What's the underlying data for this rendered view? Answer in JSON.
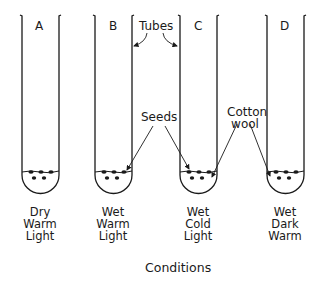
{
  "diagram": {
    "tubes": [
      {
        "letter": "A",
        "conditions": [
          "Dry",
          "Warm",
          "Light"
        ]
      },
      {
        "letter": "B",
        "conditions": [
          "Wet",
          "Warm",
          "Light"
        ]
      },
      {
        "letter": "C",
        "conditions": [
          "Wet",
          "Cold",
          "Light"
        ]
      },
      {
        "letter": "D",
        "conditions": [
          "Wet",
          "Dark",
          "Warm"
        ]
      }
    ],
    "annotations": {
      "tubes": "Tubes",
      "seeds": "Seeds",
      "cotton_wool_line1": "Cotton",
      "cotton_wool_line2": "wool"
    },
    "caption": "Conditions",
    "colors": {
      "ink": "#1a1a1a",
      "background": "#ffffff"
    }
  }
}
